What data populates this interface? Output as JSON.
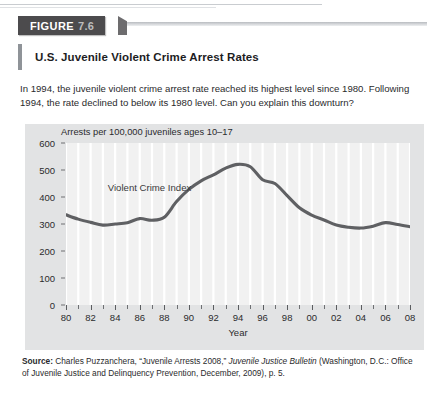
{
  "banner": {
    "figure_word": "FIGURE",
    "figure_number": "7.6"
  },
  "title": "U.S. Juvenile Violent Crime Arrest Rates",
  "intro": "In 1994, the juvenile violent crime arrest rate reached its highest level since 1980. Following 1994, the rate declined to below its 1980 level. Can you explain this downturn?",
  "source": {
    "lead": "Source:",
    "part1": " Charles Puzzanchera, “Juvenile Arrests 2008,” ",
    "italic": "Juvenile Justice Bulletin",
    "part2": " (Washington, D.C.: Office of Juvenile Justice and Delinquency Prevention, December, 2009), p. 5."
  },
  "colors": {
    "banner_bg": "#4c4b4d",
    "banner_text": "#ffffff",
    "banner_number": "#bdbdbd",
    "title_accent": "#8f9398",
    "panel_bg": "#e2e3e4",
    "plot_bg": "#f1f1f1",
    "gridline": "#ffffff",
    "series_line": "#5f6063",
    "axis": "#6e7073",
    "text": "#2a2a2c"
  },
  "chart_data": {
    "type": "line",
    "title": "Arrests per 100,000 juveniles ages 10–17",
    "xlabel": "Year",
    "ylabel": "",
    "ylim": [
      0,
      600
    ],
    "yticks": [
      0,
      100,
      200,
      300,
      400,
      500,
      600
    ],
    "ytick_labels": [
      "0",
      "100",
      "200",
      "300",
      "400",
      "500",
      "600"
    ],
    "xlim": [
      1980,
      2008
    ],
    "xticks": [
      1980,
      1981,
      1982,
      1983,
      1984,
      1985,
      1986,
      1987,
      1988,
      1989,
      1990,
      1991,
      1992,
      1993,
      1994,
      1995,
      1996,
      1997,
      1998,
      1999,
      2000,
      2001,
      2002,
      2003,
      2004,
      2005,
      2006,
      2007,
      2008
    ],
    "xtick_labels": [
      "80",
      "",
      "82",
      "",
      "84",
      "",
      "86",
      "",
      "88",
      "",
      "90",
      "",
      "92",
      "",
      "94",
      "",
      "96",
      "",
      "98",
      "",
      "00",
      "",
      "02",
      "",
      "04",
      "",
      "06",
      "",
      "08"
    ],
    "grid": "vertical",
    "legend_position": "inline-annotation",
    "series": [
      {
        "name": "Violent Crime Index",
        "x": [
          1980,
          1981,
          1982,
          1983,
          1984,
          1985,
          1986,
          1987,
          1988,
          1989,
          1990,
          1991,
          1992,
          1993,
          1994,
          1995,
          1996,
          1997,
          1998,
          1999,
          2000,
          2001,
          2002,
          2003,
          2004,
          2005,
          2006,
          2007,
          2008
        ],
        "values": [
          334,
          318,
          306,
          296,
          300,
          305,
          320,
          314,
          325,
          383,
          428,
          460,
          482,
          507,
          521,
          512,
          464,
          450,
          405,
          360,
          333,
          315,
          296,
          288,
          285,
          292,
          305,
          298,
          290
        ]
      }
    ],
    "annotations": [
      {
        "text": "Violent Crime Index",
        "x": 1983.4,
        "y": 432
      }
    ]
  }
}
